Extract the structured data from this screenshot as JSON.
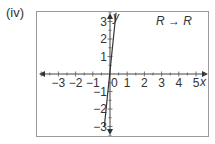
{
  "part_label": "(iv)",
  "mapping_label": "R → R",
  "chart_data": {
    "type": "line",
    "title": "",
    "annotation": "R → R",
    "xlabel": "x",
    "ylabel": "y",
    "xlim": [
      -4,
      5.5
    ],
    "ylim": [
      -3.5,
      3.5
    ],
    "x_ticks": [
      -3,
      -2,
      -1,
      0,
      1,
      2,
      3,
      4,
      5
    ],
    "x_tick_labels": [
      "−3",
      "−2",
      "−1",
      "0",
      "1",
      "2",
      "3",
      "4",
      "5"
    ],
    "y_ticks": [
      -3,
      -2,
      -1,
      1,
      2,
      3
    ],
    "y_tick_labels": [
      "−3",
      "−2",
      "−1",
      "1",
      "2",
      "3"
    ],
    "grid": false,
    "legend": null,
    "series": [
      {
        "name": "f(x)",
        "x": [
          -0.33,
          0.35
        ],
        "y": [
          -3.0,
          3.5
        ],
        "note": "steep straight line through origin, gradient approx 10"
      }
    ]
  }
}
